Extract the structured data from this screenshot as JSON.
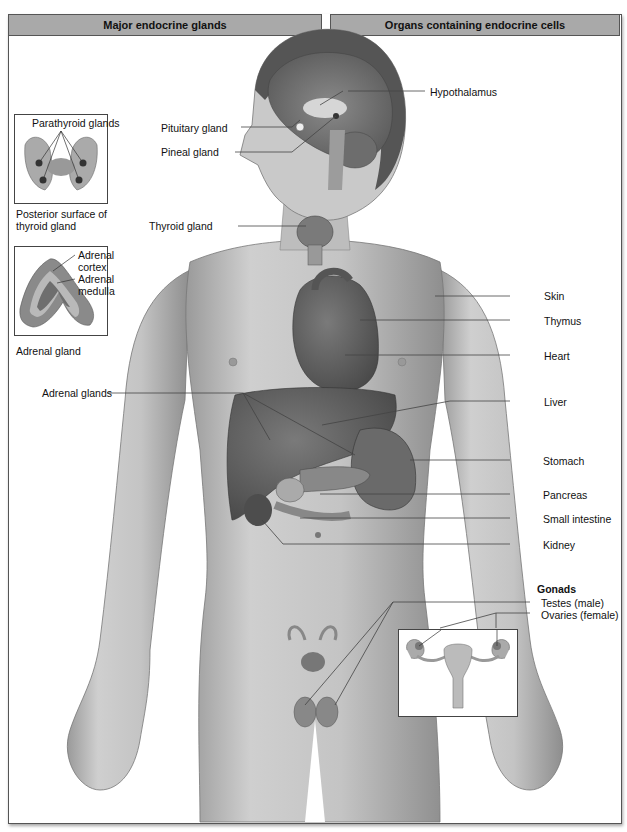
{
  "headers": {
    "left": "Major endocrine glands",
    "right": "Organs containing endocrine cells"
  },
  "insets": {
    "thyroid": {
      "label": "Parathyroid glands",
      "caption_line1": "Posterior surface of",
      "caption_line2": "thyroid gland"
    },
    "adrenal": {
      "cortex_line1": "Adrenal",
      "cortex_line2": "cortex",
      "medulla_line1": "Adrenal",
      "medulla_line2": "medulla",
      "caption": "Adrenal gland"
    }
  },
  "left_labels": {
    "pituitary": "Pituitary gland",
    "pineal": "Pineal gland",
    "thyroid": "Thyroid gland",
    "adrenal": "Adrenal glands"
  },
  "right_labels": {
    "hypothalamus": "Hypothalamus",
    "skin": "Skin",
    "thymus": "Thymus",
    "heart": "Heart",
    "liver": "Liver",
    "stomach": "Stomach",
    "pancreas": "Pancreas",
    "small_intestine": "Small intestine",
    "kidney": "Kidney"
  },
  "gonads": {
    "title": "Gonads",
    "testes": "Testes (male)",
    "ovaries": "Ovaries (female)"
  },
  "colors": {
    "header_bg": "#a9a9a9",
    "line": "#444444",
    "skin": "#c8c8c8",
    "organ_dark": "#555555"
  }
}
